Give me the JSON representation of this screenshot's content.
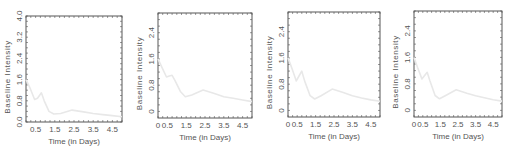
{
  "chart_data": [
    {
      "type": "line",
      "xlabel": "Time (in Days)",
      "ylabel": "Baseline Intensity",
      "xlim": [
        0,
        5
      ],
      "ylim": [
        0,
        4.0
      ],
      "x_ticks": [
        0.5,
        1.5,
        2.5,
        3.5,
        4.5
      ],
      "x_tick_labels": [
        "0.5",
        "1.5",
        "2.5",
        "3.5",
        "4.5"
      ],
      "y_ticks": [
        0.0,
        0.8,
        1.6,
        2.4,
        3.2,
        4.0
      ],
      "y_tick_labels": [
        "0.0",
        "0.8",
        "1.6",
        "2.4",
        "3.2",
        "4.0"
      ],
      "series": [
        {
          "name": "Baseline Intensity",
          "color": "#e8e8e8",
          "x": [
            0.0,
            0.2,
            0.45,
            0.6,
            0.8,
            0.95,
            1.2,
            1.45,
            1.8,
            2.4,
            3.0,
            3.5,
            4.0,
            4.5,
            5.0
          ],
          "y": [
            1.6,
            1.3,
            0.85,
            0.9,
            1.1,
            0.8,
            0.4,
            0.3,
            0.32,
            0.45,
            0.38,
            0.32,
            0.28,
            0.24,
            0.2
          ]
        }
      ]
    },
    {
      "type": "line",
      "xlabel": "Time (in Days)",
      "ylabel": "Baseline Intensity",
      "xlim": [
        0,
        5
      ],
      "ylim": [
        -0.2,
        3.0
      ],
      "x_ticks": [
        0,
        0.5,
        1.5,
        2.5,
        3.5,
        4.5
      ],
      "x_tick_labels": [
        "0",
        "0.5",
        "1.5",
        "2.5",
        "3.5",
        "4.5"
      ],
      "y_ticks": [
        0,
        0.8,
        1.6,
        2.4
      ],
      "y_tick_labels": [
        "0",
        "0.8",
        "1.6",
        "2.4"
      ],
      "series": [
        {
          "name": "Baseline Intensity",
          "color": "#e8e8e8",
          "x": [
            0.0,
            0.2,
            0.45,
            0.6,
            0.75,
            0.9,
            1.2,
            1.45,
            1.8,
            2.4,
            3.0,
            3.5,
            4.0,
            4.5,
            5.0
          ],
          "y": [
            1.6,
            1.35,
            1.05,
            1.08,
            1.1,
            0.95,
            0.6,
            0.45,
            0.5,
            0.65,
            0.55,
            0.45,
            0.4,
            0.35,
            0.3
          ]
        }
      ]
    },
    {
      "type": "line",
      "xlabel": "Time (in Days)",
      "ylabel": "Baseline Intensity",
      "xlim": [
        0,
        5
      ],
      "ylim": [
        -0.2,
        3.0
      ],
      "x_ticks": [
        0,
        0.5,
        1.5,
        2.5,
        3.5,
        4.5
      ],
      "x_tick_labels": [
        "0",
        "0.5",
        "1.5",
        "2.5",
        "3.5",
        "4.5"
      ],
      "y_ticks": [
        0,
        0.8,
        1.6,
        2.4
      ],
      "y_tick_labels": [
        "0",
        "0.8",
        "1.6",
        "2.4"
      ],
      "series": [
        {
          "name": "Baseline Intensity",
          "color": "#e8e8e8",
          "x": [
            0.0,
            0.2,
            0.45,
            0.6,
            0.75,
            0.9,
            1.2,
            1.45,
            1.8,
            2.4,
            3.0,
            3.5,
            4.0,
            4.5,
            5.0
          ],
          "y": [
            1.6,
            1.3,
            0.9,
            1.05,
            1.2,
            0.9,
            0.45,
            0.35,
            0.45,
            0.65,
            0.55,
            0.45,
            0.38,
            0.32,
            0.28
          ]
        }
      ]
    },
    {
      "type": "line",
      "xlabel": "Time (in Days)",
      "ylabel": "Baseline Intensity",
      "xlim": [
        0,
        5
      ],
      "ylim": [
        -0.2,
        3.0
      ],
      "x_ticks": [
        0,
        0.5,
        1.5,
        2.5,
        3.5,
        4.5
      ],
      "x_tick_labels": [
        "0",
        "0.5",
        "1.5",
        "2.5",
        "3.5",
        "4.5"
      ],
      "y_ticks": [
        0,
        0.8,
        1.6,
        2.4
      ],
      "y_tick_labels": [
        "0",
        "0.8",
        "1.6",
        "2.4"
      ],
      "series": [
        {
          "name": "Baseline Intensity",
          "color": "#e8e8e8",
          "x": [
            0.0,
            0.2,
            0.45,
            0.6,
            0.75,
            0.9,
            1.2,
            1.45,
            1.8,
            2.4,
            3.0,
            3.5,
            4.0,
            4.5,
            5.0
          ],
          "y": [
            1.6,
            1.3,
            0.95,
            1.05,
            1.15,
            0.9,
            0.45,
            0.35,
            0.45,
            0.62,
            0.52,
            0.44,
            0.38,
            0.32,
            0.28
          ]
        }
      ]
    }
  ]
}
